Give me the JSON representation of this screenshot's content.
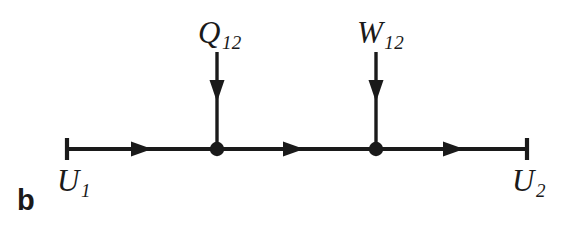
{
  "figure": {
    "panel_label": "b",
    "background_color": "#ffffff",
    "ink_color": "#1a1a1a",
    "width": 573,
    "height": 237
  },
  "labels": {
    "heat": {
      "symbol": "Q",
      "subscript": "12"
    },
    "work": {
      "symbol": "W",
      "subscript": "12"
    },
    "state_start": {
      "symbol": "U",
      "subscript": "1"
    },
    "state_end": {
      "symbol": "U",
      "subscript": "2"
    }
  },
  "diagram": {
    "type": "energy-flow-process-line",
    "axis": {
      "y": 149,
      "x_start": 66,
      "x_end": 528,
      "stroke_width": 4,
      "end_cap": "vertical-tick",
      "end_cap_half_height": 11
    },
    "nodes": [
      {
        "name": "heat-node",
        "x": 217,
        "y": 149,
        "radius": 7
      },
      {
        "name": "work-node",
        "x": 376,
        "y": 149,
        "radius": 7
      }
    ],
    "flow_arrows": [
      {
        "name": "flow-arrow-1",
        "x": 145,
        "y": 149,
        "direction": "right"
      },
      {
        "name": "flow-arrow-2",
        "x": 297,
        "y": 149,
        "direction": "right"
      },
      {
        "name": "flow-arrow-3",
        "x": 457,
        "y": 149,
        "direction": "right"
      }
    ],
    "input_arrows": [
      {
        "name": "heat-input-arrow",
        "x": 217,
        "y_top": 52,
        "y_bottom": 149,
        "arrowhead_y": 95,
        "direction": "down"
      },
      {
        "name": "work-input-arrow",
        "x": 376,
        "y_top": 52,
        "y_bottom": 149,
        "arrowhead_y": 95,
        "direction": "down"
      }
    ]
  }
}
